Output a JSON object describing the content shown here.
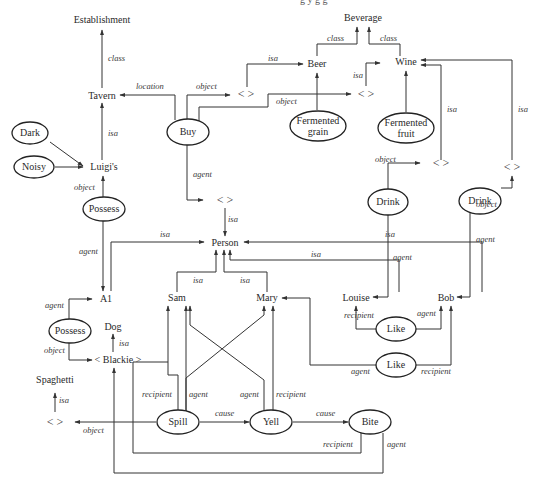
{
  "header": {
    "cut_text": "g                                  y  g  g"
  },
  "nodes": {
    "establishment": "Establishment",
    "beverage": "Beverage",
    "tavern": "Tavern",
    "beer": "Beer",
    "wine": "Wine",
    "buy": "Buy",
    "dark": "Dark",
    "noisy": "Noisy",
    "luigis": "Luigi's",
    "possess1": "Possess",
    "fermented_grain_1": "Fermented",
    "fermented_grain_2": "grain",
    "fermented_fruit_1": "Fermented",
    "fermented_fruit_2": "fruit",
    "anon_beer": "<   >",
    "anon_wine": "<   >",
    "anon_wine_drink1": "<   >",
    "anon_wine_drink2": "<   >",
    "anon_person": "<   >",
    "drink1": "Drink",
    "drink2": "Drink",
    "person": "Person",
    "a1": "A1",
    "sam": "Sam",
    "mary": "Mary",
    "louise": "Louise",
    "bob": "Bob",
    "possess2": "Possess",
    "dog": "Dog",
    "blackie": "< Blackie >",
    "like1": "Like",
    "like2": "Like",
    "spaghetti": "Spaghetti",
    "anon_spaghetti": "<   >",
    "spill": "Spill",
    "yell": "Yell",
    "bite": "Bite"
  },
  "edges": {
    "class": "class",
    "isa": "isa",
    "location": "location",
    "object": "object",
    "agent": "agent",
    "recipient": "recipient",
    "cause": "cause"
  }
}
